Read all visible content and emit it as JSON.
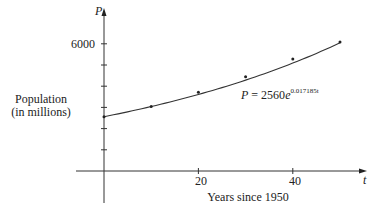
{
  "chart_data": {
    "type": "scatter",
    "title": "",
    "xlabel": "Years since 1950",
    "ylabel": "Population (in millions)",
    "ylabel_lines": [
      "Population",
      "(in millions)"
    ],
    "x_axis_symbol": "t",
    "y_axis_symbol": "P",
    "x_ticks": [
      10,
      20,
      30,
      40,
      50
    ],
    "x_tick_labels": [
      "20",
      "40"
    ],
    "y_ticks": [
      1000,
      2000,
      3000,
      4000,
      5000,
      6000
    ],
    "y_tick_labels": [
      "6000"
    ],
    "xlim": [
      0,
      53
    ],
    "ylim": [
      0,
      6500
    ],
    "grid": false,
    "series": [
      {
        "name": "Population data",
        "kind": "points",
        "x": [
          0,
          10,
          20,
          30,
          40,
          50
        ],
        "y": [
          2560,
          3040,
          3710,
          4450,
          5280,
          6080
        ]
      },
      {
        "name": "Exponential model",
        "kind": "curve",
        "equation": "P = 2560e^(0.017185t)",
        "coefficient": 2560,
        "rate": 0.017185
      }
    ],
    "annotation": {
      "prefix": "P = 2560e",
      "exponent": "0.017185t"
    }
  }
}
